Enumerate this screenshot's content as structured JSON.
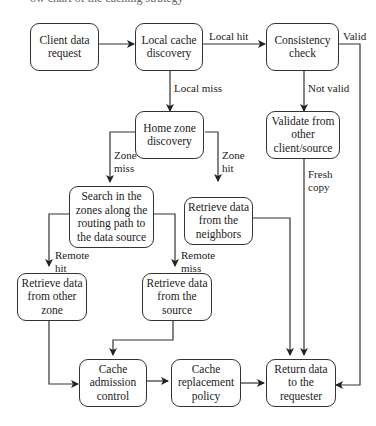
{
  "caption": "ow chart of the caching strategy",
  "nodes": {
    "client_request": "Client data request",
    "local_cache": "Local cache discovery",
    "consistency": "Consistency check",
    "home_zone": "Home zone discovery",
    "validate": "Validate from other client/source",
    "search_zones": "Search in the zones along the routing path to the data source",
    "retrieve_neighbors": "Retrieve data from the neighbors",
    "retrieve_other_zone": "Retrieve data from other zone",
    "retrieve_source": "Retrieve data from the source",
    "cache_admission": "Cache admission control",
    "cache_replacement": "Cache replacement policy",
    "return_data": "Return data to the requester"
  },
  "edge_labels": {
    "local_hit": "Local hit",
    "local_miss": "Local miss",
    "valid": "Valid",
    "not_valid": "Not valid",
    "zone_miss_1": "Zone",
    "zone_miss_2": "miss",
    "zone_hit_1": "Zone",
    "zone_hit_2": "hit",
    "fresh_copy_1": "Fresh",
    "fresh_copy_2": "copy",
    "remote_hit_1": "Remote",
    "remote_hit_2": "hit",
    "remote_miss_1": "Remote",
    "remote_miss_2": "miss"
  }
}
